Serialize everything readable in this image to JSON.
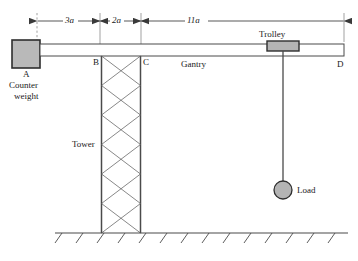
{
  "figure": {
    "type": "engineering-diagram",
    "background_color": "#ffffff",
    "line_color": "#3a3a3a",
    "fill_gray": "#b4b4b4"
  },
  "dimensions": [
    {
      "id": "dim-3a",
      "label": "3a",
      "from": "counter-weight",
      "to": "B",
      "x_start": 37,
      "x_end": 100,
      "y": 21
    },
    {
      "id": "dim-2a",
      "label": "2a",
      "from": "B",
      "to": "C",
      "x_start": 100,
      "x_end": 141,
      "y": 21
    },
    {
      "id": "dim-11a",
      "label": "11a",
      "from": "C",
      "to": "D",
      "x_start": 141,
      "x_end": 344,
      "y": 21
    }
  ],
  "labels": {
    "counter_weight_node": "A",
    "counter_weight_line1": "Counter",
    "counter_weight_line2": "weight",
    "node_b": "B",
    "node_c": "C",
    "node_d": "D",
    "gantry": "Gantry",
    "tower": "Tower",
    "trolley": "Trolley",
    "load": "Load"
  },
  "geometry": {
    "counter_weight": {
      "x": 12,
      "y": 40,
      "w": 28,
      "h": 28
    },
    "gantry_beam": {
      "x1": 40,
      "x2": 344,
      "y_top": 44,
      "y_bottom": 56
    },
    "tower": {
      "x_left": 101,
      "x_right": 141,
      "y_top": 56,
      "y_bottom": 233,
      "bays": 6
    },
    "trolley": {
      "x": 267,
      "y": 41,
      "w": 32,
      "h": 10
    },
    "cable": {
      "x": 283,
      "y_top": 51,
      "y_bottom": 182
    },
    "load": {
      "cx": 283,
      "cy": 190,
      "r": 9
    },
    "ground": {
      "x1": 55,
      "x2": 348,
      "y": 233,
      "hatch_count": 14
    }
  }
}
